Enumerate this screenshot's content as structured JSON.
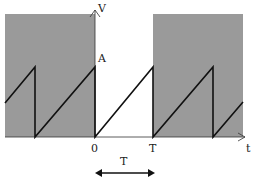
{
  "diagram": {
    "type": "sawtooth-waveform",
    "colors": {
      "shade": "#9a9a9a",
      "line": "#111111",
      "axis": "#333333",
      "background": "#ffffff"
    },
    "labels": {
      "y_axis": "V",
      "amplitude": "A",
      "origin": "0",
      "period_tick": "T",
      "x_axis": "t",
      "period_span": "T"
    },
    "waveform": {
      "amplitude_label": "A",
      "period_label": "T",
      "description": "Repeating linear ramp from 0 to A over period T, then instant drop to 0"
    },
    "shaded_regions": [
      "t < 0",
      "t > T"
    ]
  }
}
